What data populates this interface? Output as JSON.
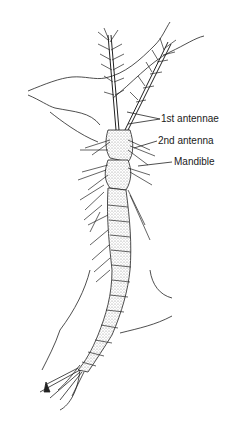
{
  "diagram": {
    "labels": [
      {
        "id": "first-antennae",
        "text": "1st antennae",
        "x": 163,
        "y": 115
      },
      {
        "id": "second-antenna",
        "text": "2nd antenna",
        "x": 159,
        "y": 137
      },
      {
        "id": "mandible",
        "text": "Mandible",
        "x": 175,
        "y": 158
      }
    ],
    "colors": {
      "line": "#1a1a1a",
      "background": "#ffffff",
      "stipple": "#9a9a9a"
    }
  }
}
